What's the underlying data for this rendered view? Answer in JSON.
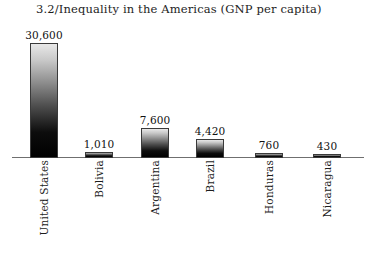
{
  "chart_data": {
    "type": "bar",
    "title": "3.2/Inequality in the Americas (GNP per capita)",
    "xlabel": "",
    "ylabel": "",
    "ylim": [
      0,
      30600
    ],
    "grid": false,
    "legend": null,
    "categories": [
      "United States",
      "Bolivia",
      "Argentina",
      "Brazil",
      "Honduras",
      "Nicaragua"
    ],
    "values": [
      30600,
      1010,
      7600,
      4420,
      760,
      430
    ],
    "value_labels": [
      "30,600",
      "1,010",
      "7,600",
      "4,420",
      "760",
      "430"
    ],
    "bars": [
      {
        "category": "United States",
        "value": 30600,
        "label": "30,600",
        "left": 30,
        "height": 115
      },
      {
        "category": "Bolivia",
        "value": 1010,
        "label": "1,010",
        "left": 85,
        "height": 6
      },
      {
        "category": "Argentina",
        "value": 7600,
        "label": "7,600",
        "left": 141,
        "height": 30
      },
      {
        "category": "Brazil",
        "value": 4420,
        "label": "4,420",
        "left": 196,
        "height": 19
      },
      {
        "category": "Honduras",
        "value": 760,
        "label": "760",
        "left": 255,
        "height": 5
      },
      {
        "category": "Nicaragua",
        "value": 430,
        "label": "430",
        "left": 313,
        "height": 4
      }
    ],
    "colors": {
      "bar_top": "#e8e8e8",
      "bar_bottom": "#000000",
      "bar_outline": "#3a3a3a",
      "axis": "#6f6f6f",
      "text": "#1d1d1d",
      "background": "#ffffff"
    }
  }
}
